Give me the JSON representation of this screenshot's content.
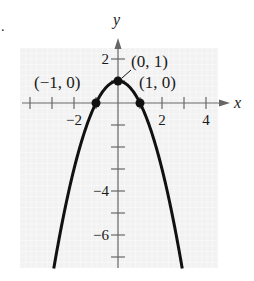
{
  "exercise_marker": ".",
  "chart_data": {
    "type": "line",
    "function": "y = 1 - x^2",
    "title": "",
    "xlabel": "x",
    "ylabel": "y",
    "xlim": [
      -4.0,
      4.8
    ],
    "ylim": [
      -7.5,
      2.9
    ],
    "grid": true,
    "x_ticks": [
      -4,
      -3,
      -2,
      -1,
      0,
      1,
      2,
      3,
      4
    ],
    "x_tick_labels": [
      {
        "value": -2,
        "label": "−2"
      },
      {
        "value": 2,
        "label": "2"
      },
      {
        "value": 4,
        "label": "4"
      }
    ],
    "y_ticks": [
      2,
      1,
      -1,
      -2,
      -3,
      -4,
      -5,
      -6,
      -7
    ],
    "y_tick_labels": [
      {
        "value": 2,
        "label": "2"
      },
      {
        "value": -4,
        "label": "−4"
      },
      {
        "value": -6,
        "label": "−6"
      }
    ],
    "series": [
      {
        "name": "parabola",
        "x": [
          -2.92,
          -2.5,
          -2,
          -1.5,
          -1,
          -0.5,
          0,
          0.5,
          1,
          1.5,
          2,
          2.5,
          2.92
        ],
        "y": [
          -7.53,
          -5.25,
          -3,
          -1.25,
          0,
          0.75,
          1,
          0.75,
          0,
          -1.25,
          -3,
          -5.25,
          -7.53
        ]
      }
    ],
    "points": [
      {
        "x": -1,
        "y": 0,
        "label": "(−1, 0)"
      },
      {
        "x": 0,
        "y": 1,
        "label": "(0, 1)"
      },
      {
        "x": 1,
        "y": 0,
        "label": "(1, 0)"
      }
    ]
  },
  "colors": {
    "grid_bg": "#f2f2f2",
    "grid_line": "#ffffff",
    "axis": "#666666",
    "curve": "#111111"
  }
}
